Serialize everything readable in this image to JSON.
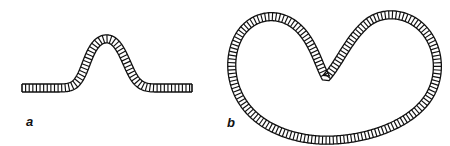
{
  "figure": {
    "width": 450,
    "height": 146,
    "background_color": "#ffffff",
    "stroke_color": "#111111",
    "rung_color": "#111111",
    "ribbon_fill": "#ffffff",
    "type": "line-diagram"
  },
  "panels": [
    {
      "id": "a",
      "label": "a",
      "label_x": 26,
      "label_y": 115,
      "shape": "open-strand-with-single-bump",
      "ribbon_width": 8,
      "rung_spacing": 3.1,
      "path": "M 22 88 L 58 88 C 72 88 76 86 82 74 C 88 61 92 41 105 39 C 118 37 124 58 131 72 C 137 84 142 88 156 88 L 192 88",
      "start_cap_x": 22,
      "end_cap_x": 192,
      "baseline_y": 88,
      "peak_x": 105,
      "peak_y": 39
    },
    {
      "id": "b",
      "label": "b",
      "label_x": 227,
      "label_y": 116,
      "shape": "closed-kidney-loop-with-notch",
      "ribbon_width": 8,
      "rung_spacing": 3.1,
      "path": "M 326 78 C 318 64 312 36 292 23 C 272 10 248 18 238 38 C 228 58 230 84 244 104 C 262 130 300 142 334 140 C 374 138 412 122 428 98 C 442 77 440 48 424 30 C 408 12 382 10 366 24 C 348 40 340 62 326 78 Z",
      "top_left_lobe": {
        "x": 272,
        "y": 16
      },
      "top_right_lobe": {
        "x": 396,
        "y": 13
      },
      "notch_bottom": {
        "x": 326,
        "y": 78
      },
      "bottom_y": 140,
      "left_x": 232,
      "right_x": 440
    }
  ],
  "labels": {
    "a": "a",
    "b": "b"
  }
}
